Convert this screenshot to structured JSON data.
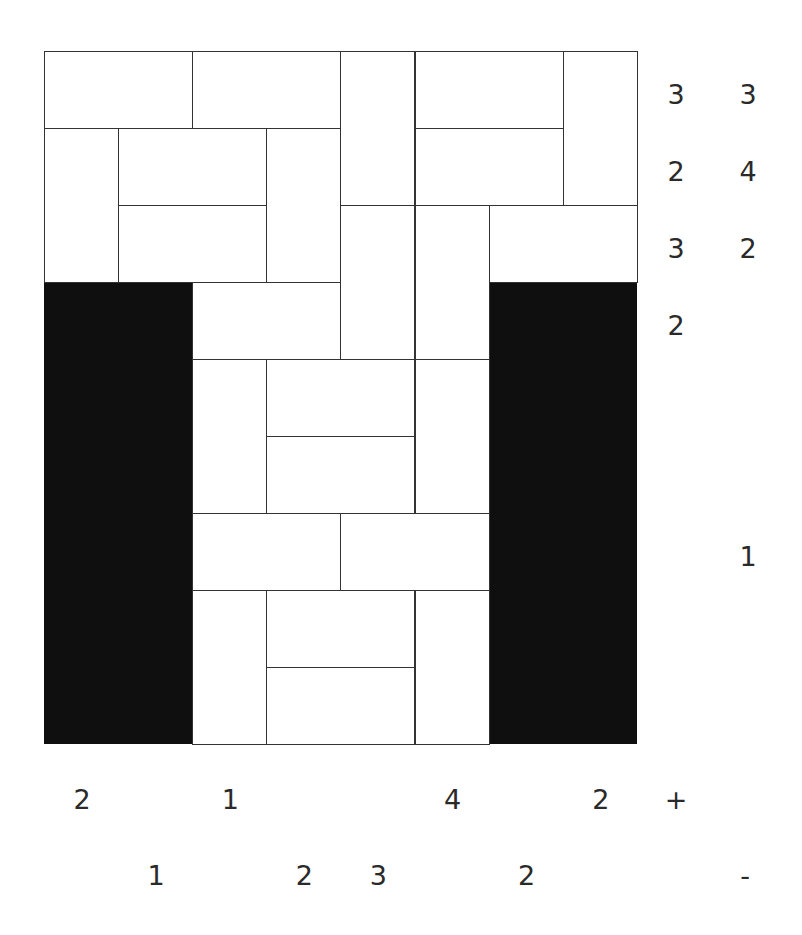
{
  "puzzle": {
    "type": "magnets",
    "rows": 9,
    "cols": 8,
    "blocked_regions": [
      {
        "name": "left-blocked",
        "col": 0,
        "row": 3,
        "w": 2,
        "h": 6
      },
      {
        "name": "right-blocked",
        "col": 6,
        "row": 3,
        "w": 2,
        "h": 6
      }
    ],
    "dominoes": [
      {
        "r": 0,
        "c": 0,
        "o": "h"
      },
      {
        "r": 0,
        "c": 2,
        "o": "h"
      },
      {
        "r": 0,
        "c": 4,
        "o": "v"
      },
      {
        "r": 0,
        "c": 5,
        "o": "h"
      },
      {
        "r": 0,
        "c": 7,
        "o": "v"
      },
      {
        "r": 1,
        "c": 0,
        "o": "v"
      },
      {
        "r": 1,
        "c": 1,
        "o": "h"
      },
      {
        "r": 1,
        "c": 3,
        "o": "v"
      },
      {
        "r": 1,
        "c": 5,
        "o": "h"
      },
      {
        "r": 2,
        "c": 1,
        "o": "h"
      },
      {
        "r": 2,
        "c": 4,
        "o": "v"
      },
      {
        "r": 2,
        "c": 5,
        "o": "v"
      },
      {
        "r": 2,
        "c": 6,
        "o": "h"
      },
      {
        "r": 3,
        "c": 2,
        "o": "h"
      },
      {
        "r": 4,
        "c": 2,
        "o": "v"
      },
      {
        "r": 4,
        "c": 3,
        "o": "h"
      },
      {
        "r": 4,
        "c": 5,
        "o": "v"
      },
      {
        "r": 5,
        "c": 3,
        "o": "h"
      },
      {
        "r": 6,
        "c": 2,
        "o": "h"
      },
      {
        "r": 6,
        "c": 4,
        "o": "h"
      },
      {
        "r": 7,
        "c": 2,
        "o": "v"
      },
      {
        "r": 7,
        "c": 3,
        "o": "h"
      },
      {
        "r": 7,
        "c": 5,
        "o": "v"
      },
      {
        "r": 8,
        "c": 3,
        "o": "h"
      }
    ],
    "row_clues_plus": [
      "3",
      "2",
      "3",
      "2",
      "",
      "",
      "",
      "",
      ""
    ],
    "row_clues_minus": [
      "3",
      "4",
      "2",
      "",
      "",
      "",
      "1",
      "",
      ""
    ],
    "col_clues_plus": [
      "2",
      "",
      "1",
      "",
      "",
      "4",
      "",
      "2"
    ],
    "col_clues_minus": [
      "",
      "1",
      "",
      "2",
      "3",
      "",
      "2",
      ""
    ],
    "plus_label": "+",
    "minus_label": "-"
  }
}
